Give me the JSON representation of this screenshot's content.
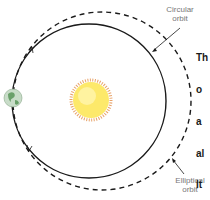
{
  "diagram": {
    "labels": {
      "circular_orbit": [
        "Circular",
        "orbit"
      ],
      "elliptical_orbit": [
        "Elliptical",
        "orbit"
      ]
    },
    "objects": {
      "sun": "sun-icon",
      "earth": "earth-icon"
    },
    "colors": {
      "orbit_line": "#1a1a1a",
      "label_text": "#777777",
      "sun_fill": "#fde96a",
      "sun_rays": "#e8a36a",
      "earth_fill": "#c8dcc8",
      "earth_land": "#6aa06a"
    }
  },
  "side_text": {
    "lines": [
      "Th",
      "o",
      "a",
      "al",
      "It",
      "fr",
      "to",
      "th",
      "d",
      "e",
      "a"
    ]
  }
}
